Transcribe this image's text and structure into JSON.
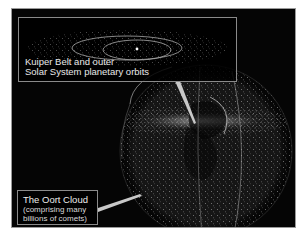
{
  "diagram": {
    "kuiper_inset": {
      "label_line1": "Kuiper Belt and outer",
      "label_line2": "Solar System planetary orbits"
    },
    "oort_label": {
      "title": "The Oort Cloud",
      "subtitle_line1": "(comprising many",
      "subtitle_line2": "billions of comets)"
    },
    "colors": {
      "background": "#050505",
      "frame_border": "#9a9a9a",
      "dots": "#d0d0d0",
      "pointer": "#bdbdbd",
      "text": "#e8e8e8"
    }
  }
}
